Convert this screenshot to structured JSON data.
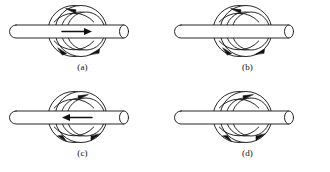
{
  "figure": {
    "type": "physics-diagram",
    "background_color": "#ffffff",
    "stroke_color": "#111111",
    "fill_color": "#ffffff",
    "grid": {
      "columns": 2,
      "rows": 2
    },
    "panels": [
      {
        "id": "a",
        "label": "(a)",
        "rod": {
          "orientation": "horizontal",
          "left_cap": "rounded",
          "right_cap": "ellipse",
          "arrow": true,
          "arrow_direction": "right",
          "arrow_label": "current-right-arrow"
        },
        "coil": {
          "turns": 2,
          "arrow_sense": "counterclockwise",
          "top_arrow_direction": "left",
          "bottom_arrow_direction": "right",
          "arrow_count": 3
        }
      },
      {
        "id": "b",
        "label": "(b)",
        "rod": {
          "orientation": "horizontal",
          "left_cap": "rounded",
          "right_cap": "ellipse",
          "arrow": false,
          "arrow_direction": "none",
          "arrow_label": ""
        },
        "coil": {
          "turns": 2,
          "arrow_sense": "counterclockwise",
          "top_arrow_direction": "left",
          "bottom_arrow_direction": "right",
          "arrow_count": 3
        }
      },
      {
        "id": "c",
        "label": "(c)",
        "rod": {
          "orientation": "horizontal",
          "left_cap": "rounded",
          "right_cap": "ellipse",
          "arrow": true,
          "arrow_direction": "left",
          "arrow_label": "current-left-arrow"
        },
        "coil": {
          "turns": 2,
          "arrow_sense": "clockwise",
          "top_arrow_direction": "right",
          "bottom_arrow_direction": "left",
          "arrow_count": 3
        }
      },
      {
        "id": "d",
        "label": "(d)",
        "rod": {
          "orientation": "horizontal",
          "left_cap": "rounded",
          "right_cap": "ellipse",
          "arrow": false,
          "arrow_direction": "none",
          "arrow_label": ""
        },
        "coil": {
          "turns": 2,
          "arrow_sense": "clockwise",
          "top_arrow_direction": "right",
          "bottom_arrow_direction": "left",
          "arrow_count": 3
        }
      }
    ]
  }
}
